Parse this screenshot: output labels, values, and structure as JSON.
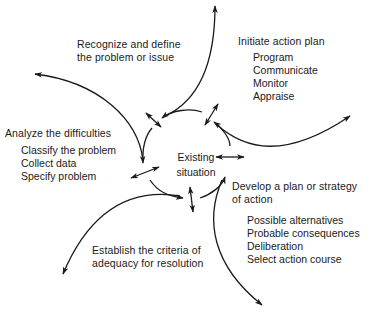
{
  "diagram": {
    "center": {
      "line1": "Existing",
      "line2": "situation"
    },
    "stages": [
      {
        "id": "recognize",
        "title_line1": "Recognize and define",
        "title_line2": "the problem or issue",
        "items": []
      },
      {
        "id": "initiate",
        "title_line1": "Initiate action plan",
        "items": [
          "Program",
          "Communicate",
          "Monitor",
          "Appraise"
        ]
      },
      {
        "id": "analyze",
        "title_line1": "Analyze the difficulties",
        "items": [
          "Classify the problem",
          "Collect data",
          "Specify problem"
        ]
      },
      {
        "id": "develop",
        "title_line1": "Develop a plan or strategy",
        "title_line2": "of action",
        "items": [
          "Possible alternatives",
          "Probable consequences",
          "Deliberation",
          "Select action course"
        ]
      },
      {
        "id": "establish",
        "title_line1": "Establish the criteria of",
        "title_line2": "adequacy for resolution",
        "items": []
      }
    ],
    "line_color": "#1a1a1a",
    "background": "#ffffff"
  }
}
